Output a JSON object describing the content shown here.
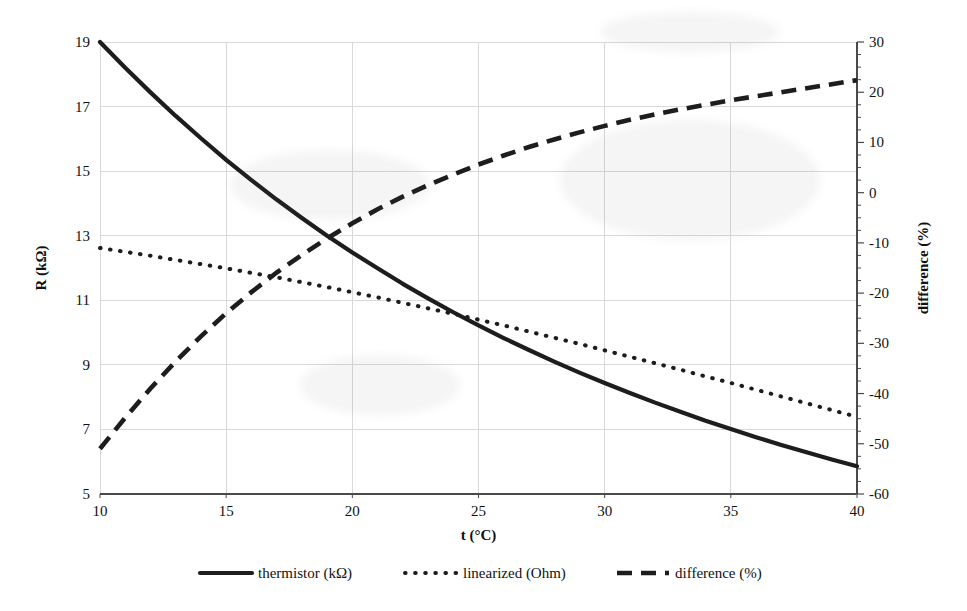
{
  "chart_data": {
    "type": "line",
    "title": "",
    "xlabel": "t (°C)",
    "ylabel": "R (kΩ)",
    "y2label": "difference (%)",
    "xlim": [
      10,
      40
    ],
    "ylim": [
      5,
      19
    ],
    "y2lim": [
      -60,
      30
    ],
    "grid": true,
    "legend_position": "bottom",
    "xticks": [
      10,
      15,
      20,
      25,
      30,
      35,
      40
    ],
    "xtick_labels": [
      "10",
      "15",
      "20",
      "25",
      "30",
      "35",
      "40"
    ],
    "yticks": [
      5,
      7,
      9,
      11,
      13,
      15,
      17,
      19
    ],
    "ytick_labels": [
      "5",
      "7",
      "9",
      "11",
      "13",
      "15",
      "17",
      "19"
    ],
    "y2ticks": [
      -60,
      -50,
      -40,
      -30,
      -20,
      -10,
      0,
      10,
      20,
      30
    ],
    "y2tick_labels": [
      "-60",
      "-50",
      "-40",
      "-30",
      "-20",
      "-10",
      "0",
      "10",
      "20",
      "30"
    ],
    "y2_minor_step": 2.5,
    "x": [
      10,
      11,
      12,
      13,
      14,
      15,
      16,
      17,
      18,
      19,
      20,
      21,
      22,
      23,
      24,
      25,
      26,
      27,
      28,
      29,
      30,
      31,
      32,
      33,
      34,
      35,
      36,
      37,
      38,
      39,
      40
    ],
    "series": [
      {
        "name": "thermistor (kΩ)",
        "axis": "left",
        "style": "solid",
        "color": "#1d1d1d",
        "values": [
          19.0,
          18.2,
          17.44,
          16.71,
          16.02,
          15.35,
          14.72,
          14.12,
          13.55,
          13.0,
          12.48,
          11.99,
          11.51,
          11.06,
          10.63,
          10.22,
          9.83,
          9.46,
          9.1,
          8.76,
          8.44,
          8.13,
          7.83,
          7.55,
          7.27,
          7.01,
          6.76,
          6.52,
          6.29,
          6.07,
          5.86
        ]
      },
      {
        "name": "linearized (Ohm)",
        "axis": "left",
        "style": "dotted",
        "color": "#1d1d1d",
        "values": [
          12.62,
          12.5,
          12.38,
          12.25,
          12.12,
          11.99,
          11.85,
          11.71,
          11.56,
          11.41,
          11.25,
          11.09,
          10.92,
          10.75,
          10.58,
          10.4,
          10.22,
          10.03,
          9.84,
          9.65,
          9.45,
          9.25,
          9.05,
          8.85,
          8.64,
          8.44,
          8.23,
          8.02,
          7.81,
          7.6,
          7.39
        ]
      },
      {
        "name": "difference (%)",
        "axis": "right",
        "style": "dashed",
        "color": "#1d1d1d",
        "values": [
          -51.0,
          -44.8,
          -39.0,
          -33.6,
          -28.6,
          -24.0,
          -19.8,
          -15.9,
          -12.4,
          -9.1,
          -6.1,
          -3.3,
          -0.8,
          1.5,
          3.6,
          5.6,
          7.4,
          9.1,
          10.6,
          12.0,
          13.3,
          14.5,
          15.6,
          16.6,
          17.5,
          18.4,
          19.2,
          20.0,
          20.8,
          21.6,
          22.4
        ]
      }
    ],
    "legend": [
      {
        "label": "thermistor (kΩ)",
        "style": "solid"
      },
      {
        "label": "linearized (Ohm)",
        "style": "dotted"
      },
      {
        "label": "difference (%)",
        "style": "dashed"
      }
    ]
  }
}
